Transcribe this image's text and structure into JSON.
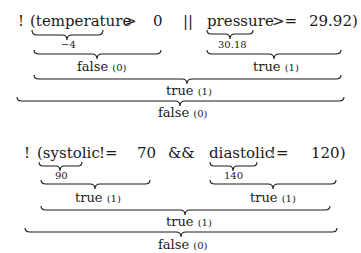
{
  "expressions": [
    {
      "tokens": {
        "not": "!",
        "open_var": "(temperature",
        "op1": ">",
        "val1": "0",
        "logic": "||",
        "var2": "pressure",
        "op2": ">=",
        "val2_close": "29.92)"
      },
      "values": {
        "var1": "−4",
        "var2": "30.18"
      },
      "results": {
        "left": {
          "word": "false",
          "num": "(0)"
        },
        "right": {
          "word": "true",
          "num": "(1)"
        },
        "combined": {
          "word": "true",
          "num": "(1)"
        },
        "final": {
          "word": "false",
          "num": "(0)"
        }
      }
    },
    {
      "tokens": {
        "not": "!",
        "open_var": "(systolic",
        "op1": "!=",
        "val1": "70",
        "logic": "&&",
        "var2": "diastolic",
        "op2": "!=",
        "val2_close": "120)"
      },
      "values": {
        "var1": "90",
        "var2": "140"
      },
      "results": {
        "left": {
          "word": "true",
          "num": "(1)"
        },
        "right": {
          "word": "true",
          "num": "(1)"
        },
        "combined": {
          "word": "true",
          "num": "(1)"
        },
        "final": {
          "word": "false",
          "num": "(0)"
        }
      }
    }
  ]
}
